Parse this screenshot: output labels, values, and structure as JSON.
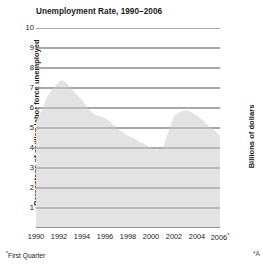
{
  "chart_data": {
    "type": "area",
    "title": "Unemployment Rate, 1990–2006",
    "xlabel": "",
    "ylabel": "Percentage of civilian labor force unemployed",
    "xlim": [
      1990,
      2006
    ],
    "ylim": [
      0,
      10
    ],
    "grid": true,
    "legend_position": "none",
    "fill_color": "#e3e3e3",
    "gridline_color": "#8a8a8a",
    "x_tick_labels": [
      "1990",
      "1992",
      "1994",
      "1996",
      "1998",
      "2000",
      "2002",
      "2004",
      "2006*"
    ],
    "x_ticks": [
      1990,
      1992,
      1994,
      1996,
      1998,
      2000,
      2002,
      2004,
      2006
    ],
    "y_tick_labels": [
      "1",
      "2",
      "3",
      "4",
      "5",
      "6",
      "7",
      "8",
      "9",
      "10"
    ],
    "y_ticks": [
      1,
      2,
      3,
      4,
      5,
      6,
      7,
      8,
      9,
      10
    ],
    "x": [
      1990,
      1990.5,
      1991,
      1991.5,
      1992,
      1992.25,
      1992.75,
      1993,
      1993.5,
      1994,
      1994.5,
      1995,
      1995.5,
      1996,
      1996.5,
      1997,
      1997.5,
      1998,
      1998.5,
      1999,
      1999.5,
      2000,
      2000.5,
      2001,
      2001.5,
      2002,
      2002.5,
      2003,
      2003.5,
      2004,
      2004.5,
      2005,
      2005.5,
      2006
    ],
    "values": [
      5.3,
      5.9,
      6.6,
      7.0,
      7.3,
      7.4,
      7.2,
      7.0,
      6.7,
      6.4,
      6.0,
      5.7,
      5.6,
      5.5,
      5.3,
      5.0,
      4.8,
      4.6,
      4.5,
      4.3,
      4.2,
      4.0,
      3.9,
      4.0,
      4.8,
      5.6,
      5.8,
      5.9,
      5.8,
      5.6,
      5.4,
      5.1,
      4.9,
      4.6
    ],
    "series": [
      {
        "name": "Unemployment rate",
        "values": [
          5.3,
          5.9,
          6.6,
          7.0,
          7.3,
          7.4,
          7.2,
          7.0,
          6.7,
          6.4,
          6.0,
          5.7,
          5.6,
          5.5,
          5.3,
          5.0,
          4.8,
          4.6,
          4.5,
          4.3,
          4.2,
          4.0,
          3.9,
          4.0,
          4.8,
          5.6,
          5.8,
          5.9,
          5.8,
          5.6,
          5.4,
          5.1,
          4.9,
          4.6
        ]
      }
    ],
    "annotations": [
      "*First Quarter"
    ]
  },
  "chart": {
    "title": "Unemployment Rate, 1990–2006",
    "y_axis_title": "Percentage of civilian labor force unemployed",
    "footnote_marker": "*",
    "footnote_text": "First Quarter",
    "last_tick_year": "2006",
    "last_tick_marker": "*"
  },
  "neighbor": {
    "axis_title": "Billions of dollars",
    "footnote_fragment": "*A"
  }
}
